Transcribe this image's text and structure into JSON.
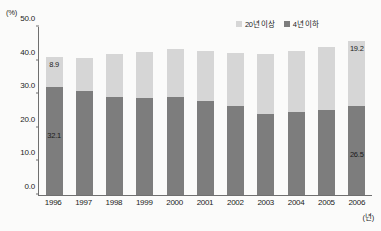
{
  "axes": {
    "y_unit": "(%)",
    "x_unit": "(년)"
  },
  "legend": {
    "items": [
      {
        "label": "20년 이상",
        "color": "#d6d6d6",
        "swatch_name": "legend-swatch-light"
      },
      {
        "label": "4년 이하",
        "color": "#7d7d7d",
        "swatch_name": "legend-swatch-dark"
      }
    ]
  },
  "colors": {
    "segment_top": "#d6d6d6",
    "segment_bottom": "#7d7d7d",
    "axis": "#6f6f6f",
    "text": "#1b1b1b",
    "background": "#fbfbfa"
  },
  "visible_labels": {
    "first_top": "8.9",
    "first_bottom": "32.1",
    "last_top": "19.2",
    "last_bottom": "26.5"
  },
  "chart_data": {
    "type": "bar",
    "stacked": true,
    "title": "",
    "xlabel": "(년)",
    "ylabel": "(%)",
    "ylim": [
      0.0,
      50.0
    ],
    "yticks": [
      "0.0",
      "10.0",
      "20.0",
      "30.0",
      "40.0",
      "50.0"
    ],
    "ytick_values": [
      0.0,
      10.0,
      20.0,
      30.0,
      40.0,
      50.0
    ],
    "grid": false,
    "legend_position": "top-right",
    "categories": [
      "1996",
      "1997",
      "1998",
      "1999",
      "2000",
      "2001",
      "2002",
      "2003",
      "2004",
      "2005",
      "2006"
    ],
    "series": [
      {
        "name": "4년 이하",
        "color": "#7d7d7d",
        "values": [
          32.1,
          31.0,
          29.2,
          29.0,
          29.1,
          27.9,
          26.5,
          24.1,
          24.7,
          25.4,
          26.5
        ],
        "labels": [
          "32.1",
          "",
          "",
          "",
          "",
          "",
          "",
          "",
          "",
          "",
          "26.5"
        ]
      },
      {
        "name": "20년 이상",
        "color": "#d6d6d6",
        "values": [
          8.9,
          9.7,
          12.7,
          13.6,
          14.4,
          15.1,
          15.7,
          17.9,
          18.1,
          18.6,
          19.2
        ],
        "labels": [
          "8.9",
          "",
          "",
          "",
          "",
          "",
          "",
          "",
          "",
          "",
          "19.2"
        ]
      }
    ],
    "totals": [
      41.0,
      40.7,
      41.9,
      42.6,
      43.5,
      43.0,
      42.2,
      42.0,
      42.8,
      44.0,
      45.7
    ]
  }
}
